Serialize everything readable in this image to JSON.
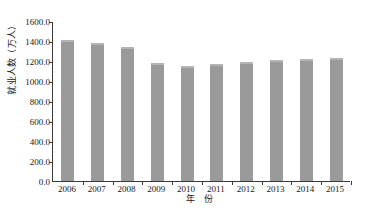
{
  "chart_data": {
    "type": "bar",
    "title": "",
    "subtitle": "",
    "xlabel": "年 份",
    "ylabel": "就业人数（万人）",
    "categories": [
      "2006",
      "2007",
      "2008",
      "2009",
      "2010",
      "2011",
      "2012",
      "2013",
      "2014",
      "2015"
    ],
    "values": [
      1415,
      1385,
      1340,
      1180,
      1150,
      1175,
      1195,
      1210,
      1225,
      1235
    ],
    "series": [
      {
        "name": "就业人数",
        "values": [
          1415,
          1385,
          1340,
          1180,
          1150,
          1175,
          1195,
          1210,
          1225,
          1235
        ]
      }
    ],
    "ylim": [
      0,
      1600
    ],
    "ytick_labels": [
      "1600.0",
      "1400.0",
      "1200.0",
      "1000.0",
      "800.0",
      "600.0",
      "400.0",
      "200.0",
      "0.0"
    ],
    "ytick_values": [
      1600,
      1400,
      1200,
      1000,
      800,
      600,
      400,
      200,
      0
    ],
    "grid": false,
    "legend": false,
    "legend_position": "none",
    "bar_color": "#9a9a9a",
    "axis_color": "#3a3a3a",
    "background_color": "#ffffff"
  }
}
